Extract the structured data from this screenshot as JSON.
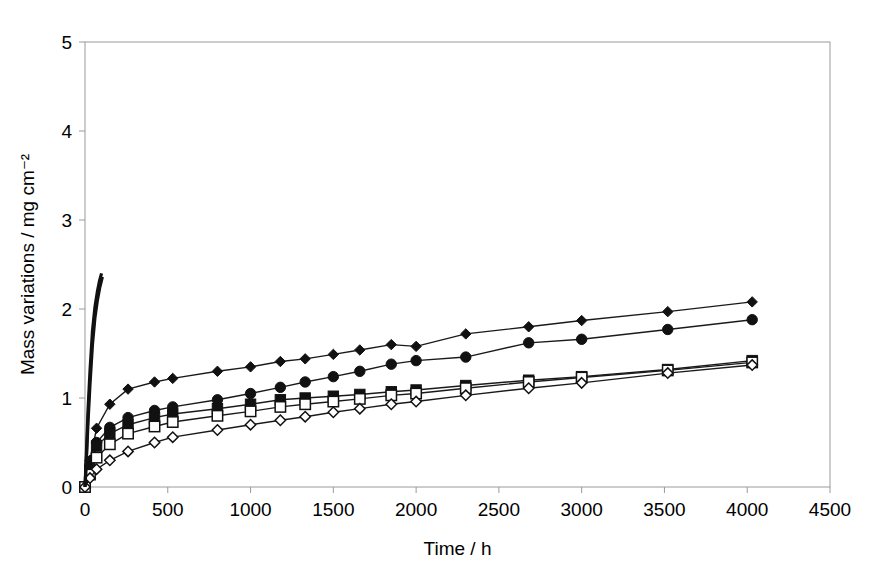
{
  "chart_data": {
    "type": "line",
    "title": "",
    "xlabel": "Time / h",
    "ylabel": "Mass variations / mg cm⁻²",
    "xlim": [
      0,
      4500
    ],
    "ylim": [
      0,
      5
    ],
    "xticks": [
      0,
      500,
      1000,
      1500,
      2000,
      2500,
      3000,
      3500,
      4000,
      4500
    ],
    "yticks": [
      0,
      1,
      2,
      3,
      4,
      5
    ],
    "xtick_labels": [
      "0",
      "500",
      "1000",
      "1500",
      "2000",
      "2500",
      "3000",
      "3500",
      "4000",
      "4500"
    ],
    "ytick_labels": [
      "0",
      "1",
      "2",
      "3",
      "4",
      "5"
    ],
    "grid": false,
    "legend": "none",
    "series": [
      {
        "name": "filled-diamond-series",
        "marker": "filled-diamond",
        "x": [
          0,
          30,
          70,
          150,
          260,
          420,
          530,
          800,
          1000,
          1180,
          1330,
          1500,
          1660,
          1850,
          2000,
          2300,
          2680,
          3000,
          3520,
          4030
        ],
        "y": [
          0.0,
          0.3,
          0.66,
          0.93,
          1.1,
          1.18,
          1.22,
          1.3,
          1.35,
          1.41,
          1.44,
          1.49,
          1.54,
          1.6,
          1.58,
          1.72,
          1.8,
          1.87,
          1.97,
          2.08
        ]
      },
      {
        "name": "filled-circle-series",
        "marker": "filled-circle",
        "x": [
          0,
          30,
          70,
          150,
          260,
          420,
          530,
          800,
          1000,
          1180,
          1330,
          1500,
          1660,
          1850,
          2000,
          2300,
          2680,
          3000,
          3520,
          4030
        ],
        "y": [
          0.0,
          0.22,
          0.5,
          0.67,
          0.78,
          0.86,
          0.9,
          0.98,
          1.05,
          1.12,
          1.18,
          1.24,
          1.3,
          1.38,
          1.42,
          1.46,
          1.62,
          1.66,
          1.77,
          1.88
        ]
      },
      {
        "name": "filled-square-series",
        "marker": "filled-square",
        "x": [
          0,
          30,
          70,
          150,
          260,
          420,
          530,
          800,
          1000,
          1180,
          1330,
          1500,
          1660,
          1850,
          2000,
          2300,
          2680,
          3000,
          3520,
          4030
        ],
        "y": [
          0.0,
          0.2,
          0.46,
          0.6,
          0.7,
          0.78,
          0.82,
          0.88,
          0.93,
          0.98,
          1.0,
          1.02,
          1.04,
          1.07,
          1.09,
          1.14,
          1.2,
          1.24,
          1.32,
          1.42
        ]
      },
      {
        "name": "open-square-series",
        "marker": "open-square",
        "x": [
          0,
          30,
          70,
          150,
          260,
          420,
          530,
          800,
          1000,
          1180,
          1330,
          1500,
          1660,
          1850,
          2000,
          2300,
          2680,
          3000,
          3520,
          4030
        ],
        "y": [
          0.0,
          0.14,
          0.33,
          0.48,
          0.6,
          0.68,
          0.73,
          0.8,
          0.85,
          0.9,
          0.93,
          0.96,
          0.99,
          1.03,
          1.05,
          1.11,
          1.18,
          1.23,
          1.31,
          1.4
        ]
      },
      {
        "name": "open-diamond-series",
        "marker": "open-diamond",
        "x": [
          0,
          30,
          70,
          150,
          260,
          420,
          530,
          800,
          1000,
          1180,
          1330,
          1500,
          1660,
          1850,
          2000,
          2300,
          2680,
          3000,
          3520,
          4030
        ],
        "y": [
          0.0,
          0.1,
          0.2,
          0.3,
          0.4,
          0.5,
          0.56,
          0.64,
          0.7,
          0.75,
          0.79,
          0.84,
          0.88,
          0.93,
          0.96,
          1.03,
          1.11,
          1.17,
          1.28,
          1.37
        ]
      },
      {
        "name": "steep-unmarked-series",
        "marker": "none",
        "x": [
          0,
          8,
          18,
          30,
          45,
          60,
          75,
          88,
          100
        ],
        "y": [
          0.0,
          0.35,
          0.85,
          1.3,
          1.75,
          2.02,
          2.2,
          2.32,
          2.4
        ]
      },
      {
        "name": "steep-unmarked-series-2",
        "marker": "none",
        "x": [
          0,
          8,
          18,
          30,
          45,
          60,
          75,
          90,
          105
        ],
        "y": [
          0.0,
          0.28,
          0.72,
          1.15,
          1.6,
          1.9,
          2.1,
          2.25,
          2.36
        ]
      }
    ]
  },
  "colors": {
    "ink": "#111111",
    "frame": "#9a9a9a",
    "background": "#ffffff"
  }
}
